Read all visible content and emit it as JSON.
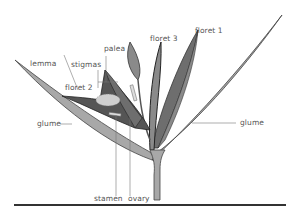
{
  "diagram": {
    "labels": {
      "floret1": "floret 1",
      "floret2": "floret 2",
      "floret3": "floret 3",
      "palea": "palea",
      "stigmas": "stigmas",
      "lemma": "lemma",
      "glume_left": "glume",
      "glume_right": "glume",
      "stamen": "stamen",
      "ovary": "ovary"
    },
    "colors": {
      "leaf_light": "#a8a8a8",
      "leaf_mid": "#8a8a8a",
      "leaf_dark": "#555555",
      "outline": "#333333",
      "label_text": "#555555",
      "leader_line": "#777777"
    }
  }
}
